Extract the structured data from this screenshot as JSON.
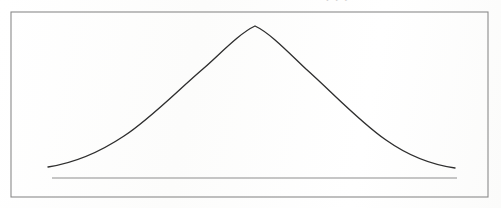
{
  "figure": {
    "kind": "line",
    "caption": "",
    "background_color": "#fdfdfc",
    "frame": {
      "name": "figure-border",
      "x": 11,
      "y": 12,
      "width": 477,
      "height": 185,
      "stroke_color": "#8a8a8a",
      "stroke_width": 1.1
    },
    "artifact": {
      "clipped_text": "f f f",
      "color": "#b9b9b9"
    }
  },
  "chart_data": {
    "type": "line",
    "title": "",
    "subtitle": "",
    "xlabel": "",
    "ylabel": "",
    "grid": false,
    "legend": false,
    "legend_position": "none",
    "annotations": [],
    "xlim": [
      48,
      455
    ],
    "ylim": [
      26,
      178
    ],
    "axis_tick_labels": {
      "x": [],
      "y": []
    },
    "series": [
      {
        "name": "normal-distribution-curve",
        "kind": "gaussian-bell",
        "color": "#2e2e2e",
        "stroke_width": 1.35,
        "peak_x": 255,
        "peak_y": 26,
        "left_end_x": 48,
        "left_end_y": 167,
        "right_end_x": 455,
        "right_end_y": 168,
        "points": [
          [
            48,
            167
          ],
          [
            70,
            161
          ],
          [
            92,
            153
          ],
          [
            114,
            143
          ],
          [
            136,
            129
          ],
          [
            158,
            112
          ],
          [
            180,
            93
          ],
          [
            202,
            72
          ],
          [
            224,
            51
          ],
          [
            240,
            36
          ],
          [
            255,
            26
          ],
          [
            270,
            31
          ],
          [
            286,
            45
          ],
          [
            308,
            66
          ],
          [
            330,
            89
          ],
          [
            352,
            111
          ],
          [
            374,
            131
          ],
          [
            396,
            146
          ],
          [
            418,
            157
          ],
          [
            436,
            164
          ],
          [
            455,
            168
          ]
        ],
        "path_d": "M 48,167 C 74,163 100,152 124,136 C 150,119 176,92 204,68 C 222,52 240,33 255,26 C 270,33 288,52 306,69 C 334,94 360,122 386,140 C 410,157 434,165 455,168"
      },
      {
        "name": "baseline-rule",
        "kind": "horizontal-line",
        "color": "#8d8d8d",
        "stroke_width": 1.05,
        "x_start": 52,
        "x_end": 457,
        "y": 178
      }
    ]
  }
}
